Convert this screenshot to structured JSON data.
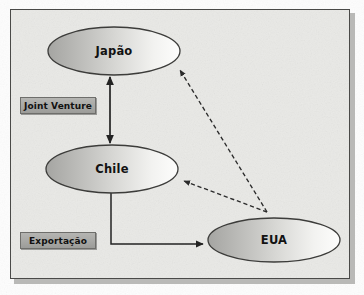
{
  "diagram": {
    "background_color": "#e9e9e6",
    "frame_border_color": "#4a4a48",
    "nodes": [
      {
        "id": "japao",
        "label": "Japão",
        "shape": "ellipse",
        "cx": 114,
        "cy": 51,
        "rx": 66,
        "ry": 24,
        "fill_from": "#a9a9a6",
        "fill_to": "#fbfbfa",
        "stroke": "#3c3c3a"
      },
      {
        "id": "chile",
        "label": "Chile",
        "shape": "ellipse",
        "cx": 112,
        "cy": 169,
        "rx": 66,
        "ry": 24,
        "fill_from": "#a9a9a6",
        "fill_to": "#fbfbfa",
        "stroke": "#3c3c3a"
      },
      {
        "id": "eua",
        "label": "EUA",
        "shape": "ellipse",
        "cx": 274,
        "cy": 240,
        "rx": 66,
        "ry": 22,
        "fill_from": "#a9a9a6",
        "fill_to": "#fbfbfa",
        "stroke": "#3c3c3a"
      }
    ],
    "annotations": [
      {
        "id": "joint-venture",
        "label": "Joint Venture",
        "x": 20,
        "y": 97,
        "width": 76,
        "height": 17,
        "fill": "#a8a8a5",
        "text_color": "#111111"
      },
      {
        "id": "exportacao",
        "label": "Exportação",
        "x": 20,
        "y": 232,
        "width": 76,
        "height": 17,
        "fill": "#a8a8a5",
        "text_color": "#111111"
      }
    ],
    "edges": [
      {
        "id": "japao-chile",
        "from": "japao",
        "to": "chile",
        "style": "solid",
        "arrow": "double",
        "label_ref": "joint-venture",
        "color": "#232323"
      },
      {
        "id": "chile-eua",
        "from": "chile",
        "to": "eua",
        "style": "solid",
        "arrow": "single",
        "routing": "elbow",
        "label_ref": "exportacao",
        "color": "#232323"
      },
      {
        "id": "eua-japao",
        "from": "eua",
        "to": "japao",
        "style": "dashed",
        "arrow": "single",
        "color": "#2b2b2b"
      },
      {
        "id": "eua-chile",
        "from": "eua",
        "to": "chile",
        "style": "dashed",
        "arrow": "single",
        "color": "#2b2b2b"
      }
    ]
  }
}
